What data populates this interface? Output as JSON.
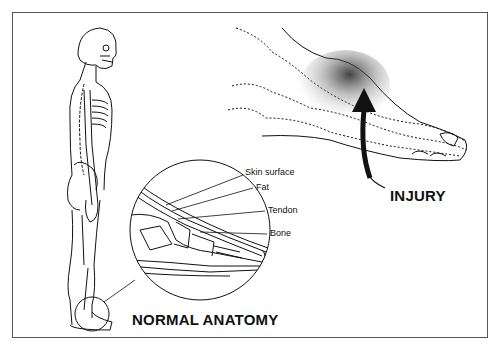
{
  "figure": {
    "type": "medical illustration",
    "sections": {
      "normal": {
        "title": "NORMAL ANATOMY",
        "labels": [
          "Skin surface",
          "Fat",
          "Tendon",
          "Bone"
        ]
      },
      "injury": {
        "title": "INJURY"
      }
    },
    "colors": {
      "ink": "#111111",
      "border": "#555555",
      "background": "#ffffff"
    }
  }
}
